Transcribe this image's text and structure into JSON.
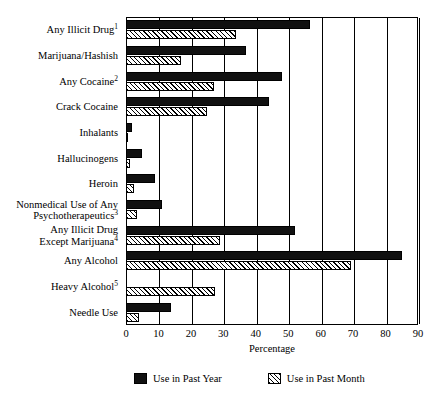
{
  "chart_data": {
    "type": "bar",
    "orientation": "horizontal",
    "title": "",
    "xlabel": "Percentage",
    "ylabel": "",
    "xlim": [
      0,
      90
    ],
    "xticks": [
      0,
      10,
      20,
      30,
      40,
      50,
      60,
      70,
      80,
      90
    ],
    "grid": true,
    "grid_axis": "x",
    "legend_position": "bottom",
    "categories": [
      "Any Illicit Drug",
      "Marijuana/Hashish",
      "Any Cocaine",
      "Crack Cocaine",
      "Inhalants",
      "Hallucinogens",
      "Heroin",
      "Nonmedical Use of Any Psychotherapeutics",
      "Any Illicit Drug Except Marijuana",
      "Any Alcohol",
      "Heavy Alcohol",
      "Needle Use"
    ],
    "category_labels": [
      {
        "line1": "Any Illicit Drug",
        "line2": "",
        "sup": "1"
      },
      {
        "line1": "Marijuana/Hashish",
        "line2": "",
        "sup": ""
      },
      {
        "line1": "Any Cocaine",
        "line2": "",
        "sup": "2"
      },
      {
        "line1": "Crack Cocaine",
        "line2": "",
        "sup": ""
      },
      {
        "line1": "Inhalants",
        "line2": "",
        "sup": ""
      },
      {
        "line1": "Hallucinogens",
        "line2": "",
        "sup": ""
      },
      {
        "line1": "Heroin",
        "line2": "",
        "sup": ""
      },
      {
        "line1": "Nonmedical Use of Any",
        "line2": "Psychotherapeutics",
        "sup": "3"
      },
      {
        "line1": "Any Illicit Drug",
        "line2": "Except Marijuana",
        "sup": "4"
      },
      {
        "line1": "Any Alcohol",
        "line2": "",
        "sup": ""
      },
      {
        "line1": "Heavy Alcohol",
        "line2": "",
        "sup": "5"
      },
      {
        "line1": "Needle Use",
        "line2": "",
        "sup": ""
      }
    ],
    "series": [
      {
        "name": "Use in Past Year",
        "style": "solid-black",
        "color": "#111111",
        "values": [
          56.8,
          37.0,
          48.0,
          44.0,
          2.0,
          5.0,
          9.0,
          11.0,
          52.0,
          85.0,
          0,
          14.0
        ]
      },
      {
        "name": "Use in Past Month",
        "style": "hatched",
        "color": "#ffffff",
        "values": [
          34.0,
          17.0,
          27.0,
          25.0,
          0.6,
          1.2,
          2.5,
          3.5,
          29.0,
          69.5,
          27.5,
          4.0
        ]
      }
    ]
  },
  "legend": {
    "items": [
      {
        "label": "Use in Past Year",
        "swatch": "solid-black"
      },
      {
        "label": "Use in Past Month",
        "swatch": "hatched"
      }
    ]
  },
  "axis": {
    "x_label": "Percentage",
    "tick_labels": [
      "0",
      "10",
      "20",
      "30",
      "40",
      "50",
      "60",
      "70",
      "80",
      "90"
    ]
  }
}
